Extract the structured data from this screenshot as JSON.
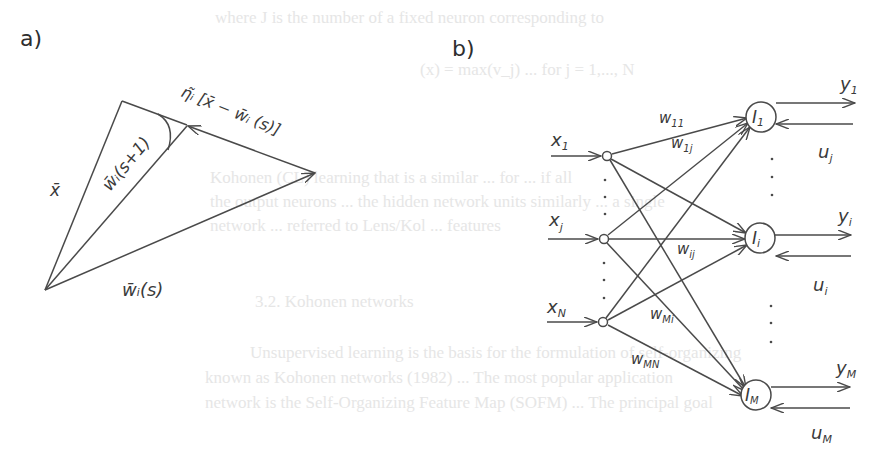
{
  "background_text": {
    "line1": "where J is the number of a fixed neuron corresponding to",
    "line2": "(x) = max(v_j) ... for j = 1,..., N",
    "line3": "Kohonen (CL) learning that is a similar ... for ... if all",
    "line4": "the output neurons ... the hidden network units similarly ... a single",
    "line5": "network ... referred to Lens/Kol ... features",
    "line6": "3.2. Kohonen networks",
    "line7": "Unsupervised learning is the basis for the formulation of self-organizing",
    "line8": "known as Kohonen networks (1982) ... The most popular application",
    "line9": "network is the Self-Organizing Feature Map (SOFM) ... The principal goal"
  },
  "panel_a": {
    "label": "a)",
    "vectors": {
      "x": "x̄",
      "w_next": "w̄ᵢ(s+1)",
      "w_current": "w̄ᵢ(s)",
      "update": "η̃ᵢ [x̄ − w̄ᵢ (s)]"
    }
  },
  "panel_b": {
    "label": "b)",
    "inputs": [
      {
        "label": "x₁",
        "id": "x1"
      },
      {
        "label": "xⱼ",
        "id": "xj"
      },
      {
        "label": "x_N",
        "sub": "N",
        "base": "x",
        "id": "xN"
      }
    ],
    "outputs": [
      {
        "neuron": "I",
        "neuron_sub": "1",
        "y": "y",
        "y_sub": "1",
        "u": "u",
        "u_sub": "j"
      },
      {
        "neuron": "I",
        "neuron_sub": "i",
        "y": "y",
        "y_sub": "i",
        "u": "u",
        "u_sub": "i"
      },
      {
        "neuron": "I",
        "neuron_sub": "M",
        "y": "y",
        "y_sub": "M",
        "u": "u",
        "u_sub": "M"
      }
    ],
    "weights": [
      {
        "base": "w",
        "sub": "11"
      },
      {
        "base": "w",
        "sub": "1j"
      },
      {
        "base": "w",
        "sub": "ij"
      },
      {
        "base": "w",
        "sub": "Mi"
      },
      {
        "base": "w",
        "sub": "MN"
      }
    ],
    "ellipsis": "⋮"
  }
}
